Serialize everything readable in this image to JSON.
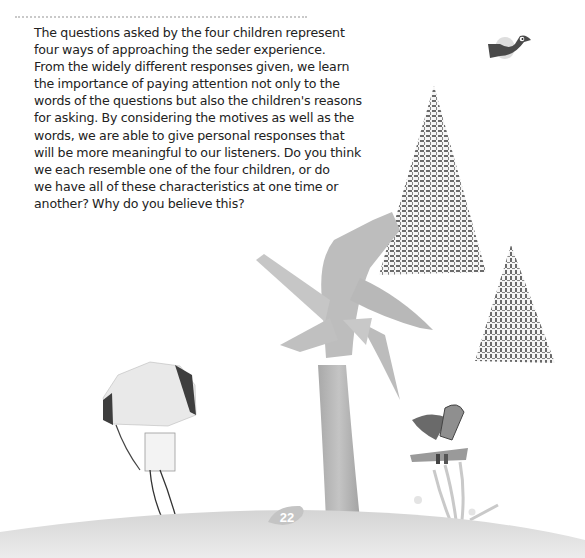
{
  "page": {
    "number": "22",
    "paragraph_lines": [
      "The questions asked by the four children represent",
      "four ways of approaching the seder experience.",
      "From the widely different responses given, we learn",
      "the importance of paying attention not only to the",
      "words of the questions but also the children's reasons",
      "for asking. By considering the motives as well as the",
      "words, we are able to give personal responses that",
      "will be more meaningful to our listeners. Do you think",
      "we each resemble one of the four children, or do",
      "we have all of these characteristics at one time or",
      "another? Why do you believe this?"
    ]
  },
  "illustration": {
    "elements": [
      "bird",
      "large-textured-triangle",
      "small-textured-triangle",
      "collage-tree",
      "hooded-child-figure",
      "small-figure-with-plants",
      "ground-hill"
    ],
    "colors": {
      "text": "#222222",
      "rule": "#c9c9c9",
      "ground": "#dcdcdc",
      "tree": "#b5b5b5",
      "texture": "#555555",
      "dark": "#444444"
    }
  }
}
